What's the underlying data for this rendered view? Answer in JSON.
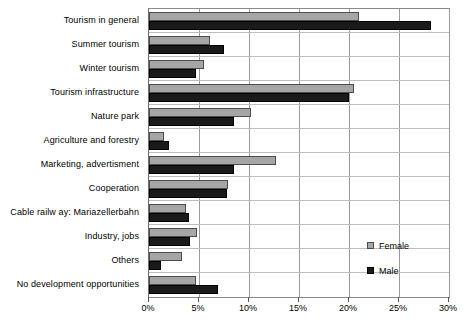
{
  "chart_data": {
    "type": "bar",
    "orientation": "horizontal",
    "title": "",
    "subtitle": "",
    "xlabel": "",
    "ylabel": "",
    "xlim": [
      0,
      30
    ],
    "xtick_labels": [
      "0%",
      "5%",
      "10%",
      "15%",
      "20%",
      "25%",
      "30%"
    ],
    "xticks": [
      0,
      5,
      10,
      15,
      20,
      25,
      30
    ],
    "grid": true,
    "grid_axis": "x",
    "legend_position": "inside-right",
    "categories": [
      "Tourism in general",
      "Summer tourism",
      "Winter tourism",
      "Tourism infrastructure",
      "Nature park",
      "Agriculture and forestry",
      "Marketing, advertisment",
      "Cooperation",
      "Cable railw ay: Mariazellerbahn",
      "Industry, jobs",
      "Others",
      "No development opportunities"
    ],
    "series": [
      {
        "name": "Female",
        "color": "#a6a6a6",
        "values": [
          21.0,
          6.1,
          5.5,
          20.5,
          10.2,
          1.5,
          12.7,
          7.9,
          3.7,
          4.8,
          3.3,
          4.7
        ]
      },
      {
        "name": "Male",
        "color": "#1a1a1a",
        "values": [
          28.2,
          7.5,
          4.7,
          20.0,
          8.5,
          2.0,
          8.5,
          7.8,
          4.0,
          4.1,
          1.2,
          6.9
        ]
      }
    ]
  },
  "legend": {
    "items": [
      {
        "label": "Female",
        "swatch": "female-swatch-icon"
      },
      {
        "label": "Male",
        "swatch": "male-swatch-icon"
      }
    ]
  }
}
